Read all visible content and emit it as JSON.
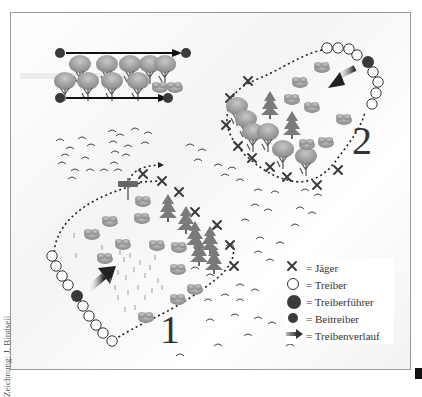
{
  "diagram": {
    "drive_labels": [
      "1",
      "2"
    ],
    "credit": "Zeichnung: J. Bindseil",
    "colors": {
      "dark_dot": "#3a3a3a",
      "hunter_x": "#3a3a3a",
      "path": "#222222",
      "tree": "#7a7a7a",
      "bush": "#9a9a9a",
      "frame": "#9a9a9a"
    },
    "legend": {
      "items": [
        {
          "icon": "cross-icon",
          "label": "= Jäger"
        },
        {
          "icon": "open-circle-icon",
          "label": "= Treiber"
        },
        {
          "icon": "large-filled-circle-icon",
          "label": "= Treiberführer"
        },
        {
          "icon": "small-filled-circle-icon",
          "label": "= Beitreiber"
        },
        {
          "icon": "arrow-icon",
          "label": "= Treibenverlauf"
        }
      ]
    }
  }
}
